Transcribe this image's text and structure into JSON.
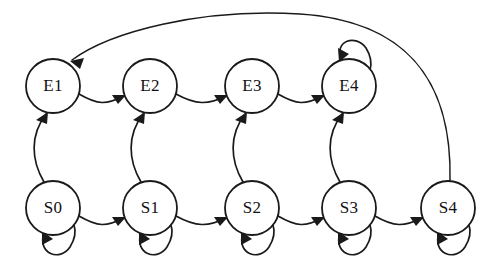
{
  "diagram": {
    "type": "state-transition-diagram",
    "title": "",
    "width": 486,
    "height": 277,
    "background_color": "#ffffff",
    "stroke_color": "#1a1a1a",
    "label_color": "#111111",
    "node_radius": 27,
    "nodes": [
      {
        "id": "E1",
        "label": "E1",
        "cx": 53,
        "cy": 86,
        "row": "top"
      },
      {
        "id": "E2",
        "label": "E2",
        "cx": 150,
        "cy": 86,
        "row": "top"
      },
      {
        "id": "E3",
        "label": "E3",
        "cx": 252,
        "cy": 86,
        "row": "top"
      },
      {
        "id": "E4",
        "label": "E4",
        "cx": 349,
        "cy": 86,
        "row": "top"
      },
      {
        "id": "S0",
        "label": "S0",
        "cx": 53,
        "cy": 208,
        "row": "bottom"
      },
      {
        "id": "S1",
        "label": "S1",
        "cx": 150,
        "cy": 208,
        "row": "bottom"
      },
      {
        "id": "S2",
        "label": "S2",
        "cx": 252,
        "cy": 208,
        "row": "bottom"
      },
      {
        "id": "S3",
        "label": "S3",
        "cx": 349,
        "cy": 208,
        "row": "bottom"
      },
      {
        "id": "S4",
        "label": "S4",
        "cx": 448,
        "cy": 208,
        "row": "bottom"
      }
    ],
    "edges": [
      {
        "from": "E1",
        "to": "E2",
        "kind": "horizontal",
        "label": ""
      },
      {
        "from": "E2",
        "to": "E3",
        "kind": "horizontal",
        "label": ""
      },
      {
        "from": "E3",
        "to": "E4",
        "kind": "horizontal",
        "label": ""
      },
      {
        "from": "S0",
        "to": "S1",
        "kind": "horizontal",
        "label": ""
      },
      {
        "from": "S1",
        "to": "S2",
        "kind": "horizontal",
        "label": ""
      },
      {
        "from": "S2",
        "to": "S3",
        "kind": "horizontal",
        "label": ""
      },
      {
        "from": "S3",
        "to": "S4",
        "kind": "horizontal",
        "label": ""
      },
      {
        "from": "S0",
        "to": "E1",
        "kind": "vertical",
        "label": ""
      },
      {
        "from": "S1",
        "to": "E2",
        "kind": "vertical",
        "label": ""
      },
      {
        "from": "S2",
        "to": "E3",
        "kind": "vertical",
        "label": ""
      },
      {
        "from": "S3",
        "to": "E4",
        "kind": "vertical",
        "label": ""
      },
      {
        "from": "S4",
        "to": "E1",
        "kind": "long-return-arc",
        "label": ""
      },
      {
        "from": "E4",
        "to": "E4",
        "kind": "self-loop-top",
        "label": ""
      },
      {
        "from": "S0",
        "to": "S0",
        "kind": "self-loop-bottom",
        "label": ""
      },
      {
        "from": "S1",
        "to": "S1",
        "kind": "self-loop-bottom",
        "label": ""
      },
      {
        "from": "S2",
        "to": "S2",
        "kind": "self-loop-bottom",
        "label": ""
      },
      {
        "from": "S3",
        "to": "S3",
        "kind": "self-loop-bottom",
        "label": ""
      },
      {
        "from": "S4",
        "to": "S4",
        "kind": "self-loop-bottom",
        "label": ""
      }
    ]
  }
}
